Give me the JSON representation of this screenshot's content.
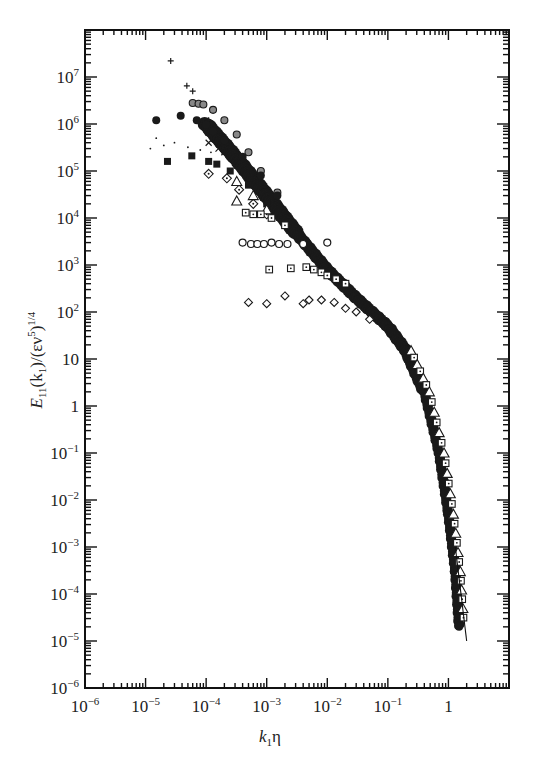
{
  "chart_data": {
    "type": "scatter",
    "title": "",
    "xlabel": "k1η",
    "ylabel": "E11(k1)/(εν^5)^1/4",
    "xscale": "log",
    "yscale": "log",
    "xlim": [
      1e-06,
      10
    ],
    "ylim": [
      1e-06,
      100000000.0
    ],
    "grid": false,
    "legend": null,
    "x_ticks": [
      "10^-6",
      "10^-5",
      "10^-4",
      "10^-3",
      "10^-2",
      "10^-1",
      "1"
    ],
    "y_ticks": [
      "10^-6",
      "10^-5",
      "10^-4",
      "10^-3",
      "10^-2",
      "10^-1",
      "1",
      "10",
      "10^2",
      "10^3",
      "10^4",
      "10^5",
      "10^6",
      "10^7"
    ],
    "series": [
      {
        "name": "plus",
        "marker": "+",
        "points": [
          [
            2.6e-05,
            22000000.0
          ],
          [
            4.8e-05,
            6500000.0
          ],
          [
            6e-05,
            5000000.0
          ],
          [
            0.00011,
            1200000.0
          ]
        ]
      },
      {
        "name": "hatched-circle",
        "marker": "circle-hatched",
        "points": [
          [
            6e-05,
            2800000.0
          ],
          [
            7.5e-05,
            2700000.0
          ],
          [
            9e-05,
            2600000.0
          ],
          [
            0.00013,
            2000000.0
          ],
          [
            0.0002,
            1200000.0
          ],
          [
            0.00032,
            600000.0
          ],
          [
            0.0005,
            250000.0
          ],
          [
            0.0008,
            100000.0
          ],
          [
            0.0015,
            35000.0
          ]
        ]
      },
      {
        "name": "filled-circle",
        "marker": "circle-filled",
        "points": [
          [
            1.5e-05,
            1200000.0
          ],
          [
            3.8e-05,
            1500000.0
          ],
          [
            7e-05,
            1200000.0
          ],
          [
            0.0001,
            960000.0
          ],
          [
            0.00013,
            700000.0
          ],
          [
            0.0002,
            450000.0
          ],
          [
            0.0004,
            200000.0
          ],
          [
            0.0008,
            80000.0
          ],
          [
            0.0015,
            30000.0
          ]
        ]
      },
      {
        "name": "dot",
        "marker": "dot",
        "points": [
          [
            1.2e-05,
            300000.0
          ],
          [
            1.5e-05,
            500000.0
          ],
          [
            2e-05,
            350000.0
          ],
          [
            3e-05,
            400000.0
          ],
          [
            5e-05,
            320000.0
          ],
          [
            8e-05,
            280000.0
          ],
          [
            0.00012,
            250000.0
          ]
        ]
      },
      {
        "name": "cross",
        "marker": "x",
        "points": [
          [
            0.00011,
            400000.0
          ],
          [
            0.00016,
            300000.0
          ],
          [
            0.0002,
            250000.0
          ],
          [
            0.0003,
            150000.0
          ]
        ]
      },
      {
        "name": "filled-square",
        "marker": "square-filled",
        "points": [
          [
            2.3e-05,
            160000.0
          ],
          [
            5.8e-05,
            210000.0
          ],
          [
            0.00011,
            160000.0
          ],
          [
            0.00015,
            140000.0
          ],
          [
            0.00025,
            100000.0
          ],
          [
            0.0005,
            50000.0
          ],
          [
            0.001,
            20000.0
          ]
        ]
      },
      {
        "name": "dotted-diamond",
        "marker": "diamond-dotted",
        "points": [
          [
            0.00011,
            87000.0
          ],
          [
            0.00022,
            70000.0
          ],
          [
            0.00035,
            40000.0
          ],
          [
            0.0006,
            20000.0
          ],
          [
            0.001,
            12000.0
          ]
        ]
      },
      {
        "name": "triangle",
        "marker": "triangle-open",
        "points": [
          [
            0.00032,
            60000.0
          ],
          [
            0.00032,
            23000.0
          ],
          [
            0.0006,
            30000.0
          ],
          [
            0.001,
            15000.0
          ]
        ]
      },
      {
        "name": "dotted-square-high",
        "marker": "square-dotted",
        "points": [
          [
            0.00045,
            13000.0
          ],
          [
            0.0006,
            12000.0
          ],
          [
            0.0008,
            12000.0
          ],
          [
            0.0012,
            10000.0
          ],
          [
            0.002,
            7000.0
          ]
        ]
      },
      {
        "name": "open-circle",
        "marker": "circle-open",
        "points": [
          [
            0.0004,
            3000.0
          ],
          [
            0.00055,
            2800.0
          ],
          [
            0.0007,
            2800.0
          ],
          [
            0.0009,
            2800.0
          ],
          [
            0.0012,
            3000.0
          ],
          [
            0.0016,
            2800.0
          ],
          [
            0.0022,
            2800.0
          ],
          [
            0.004,
            2800.0
          ],
          [
            0.01,
            3000.0
          ]
        ]
      },
      {
        "name": "dotted-square",
        "marker": "square-dotted",
        "points": [
          [
            0.0011,
            800.0
          ],
          [
            0.0025,
            850.0
          ],
          [
            0.0045,
            900.0
          ],
          [
            0.006,
            800.0
          ],
          [
            0.008,
            700.0
          ],
          [
            0.01,
            600.0
          ],
          [
            0.014,
            500.0
          ],
          [
            0.02,
            400.0
          ]
        ]
      },
      {
        "name": "open-diamond",
        "marker": "diamond-open",
        "points": [
          [
            0.0005,
            160.0
          ],
          [
            0.001,
            150.0
          ],
          [
            0.002,
            220.0
          ],
          [
            0.004,
            150.0
          ],
          [
            0.005,
            180.0
          ],
          [
            0.008,
            180.0
          ],
          [
            0.013,
            160.0
          ],
          [
            0.02,
            120.0
          ],
          [
            0.03,
            100.0
          ],
          [
            0.05,
            70.0
          ]
        ]
      },
      {
        "name": "master-curve",
        "marker": "dense-mixed",
        "points": [
          [
            0.0001,
            1000000.0
          ],
          [
            0.0003,
            200000.0
          ],
          [
            0.001,
            30000.0
          ],
          [
            0.003,
            5000.0
          ],
          [
            0.01,
            800.0
          ],
          [
            0.03,
            200.0
          ],
          [
            0.1,
            50.0
          ],
          [
            0.2,
            15.0
          ],
          [
            0.4,
            2.0
          ],
          [
            0.7,
            0.1
          ],
          [
            1.0,
            0.005
          ],
          [
            1.3,
            0.0003
          ],
          [
            1.5,
            2e-05
          ]
        ]
      },
      {
        "name": "reference-line",
        "marker": "line",
        "points": [
          [
            1.3,
            0.001
          ],
          [
            2.0,
            1e-05
          ]
        ]
      }
    ]
  },
  "axes": {
    "x_label_main": "k",
    "x_label_sub": "1",
    "x_label_tail": "η",
    "y_label_main": "E",
    "y_label_sub1": "11",
    "y_label_mid": "(k",
    "y_label_sub2": "1",
    "y_label_tail": ")/(εν",
    "y_label_sup5": "5",
    "y_label_close": ")",
    "y_label_sup": "1/4",
    "x_ticks": [
      {
        "base": "10",
        "exp": "−6"
      },
      {
        "base": "10",
        "exp": "−5"
      },
      {
        "base": "10",
        "exp": "−4"
      },
      {
        "base": "10",
        "exp": "−3"
      },
      {
        "base": "10",
        "exp": "−2"
      },
      {
        "base": "10",
        "exp": "−1"
      },
      {
        "base": "1",
        "exp": ""
      }
    ],
    "y_ticks": [
      {
        "base": "10",
        "exp": "7"
      },
      {
        "base": "10",
        "exp": "6"
      },
      {
        "base": "10",
        "exp": "5"
      },
      {
        "base": "10",
        "exp": "4"
      },
      {
        "base": "10",
        "exp": "3"
      },
      {
        "base": "10",
        "exp": "2"
      },
      {
        "base": "10",
        "exp": ""
      },
      {
        "base": "1",
        "exp": ""
      },
      {
        "base": "10",
        "exp": "−1"
      },
      {
        "base": "10",
        "exp": "−2"
      },
      {
        "base": "10",
        "exp": "−3"
      },
      {
        "base": "10",
        "exp": "−4"
      },
      {
        "base": "10",
        "exp": "−5"
      },
      {
        "base": "10",
        "exp": "−6"
      }
    ]
  }
}
